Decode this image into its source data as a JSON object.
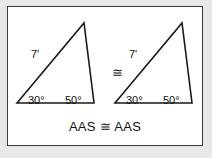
{
  "figure": {
    "caption": "AAS ≅ AAS",
    "congruence_symbol": "≅",
    "triangles": [
      {
        "name": "left-triangle",
        "side_label": "7'",
        "angle_left": "30°",
        "angle_right": "50°"
      },
      {
        "name": "right-triangle",
        "side_label": "7'",
        "angle_left": "30°",
        "angle_right": "50°"
      }
    ]
  },
  "colors": {
    "page_background": "#e8e8e8",
    "panel_background": "#ffffff",
    "border": "#3b3b3b",
    "ink": "#111111",
    "stroke": "#1a1a1a"
  }
}
